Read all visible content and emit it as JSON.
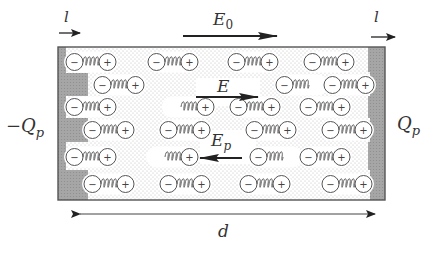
{
  "diagram": {
    "title_labels": {
      "current_left": "l",
      "current_right": "l",
      "applied_field": "E",
      "applied_field_sub": "0",
      "net_field": "E",
      "polarization_field": "E",
      "polarization_field_sub": "p",
      "left_charge_prefix": "−Q",
      "left_charge_sub": "p",
      "right_charge": "Q",
      "right_charge_sub": "p",
      "separation": "d"
    },
    "dipole": {
      "negative_symbol": "−",
      "positive_symbol": "+"
    },
    "colors": {
      "plate": "#a8a8a8",
      "dielectric_stipple": "#c8c8c8",
      "outline": "#555555",
      "arrow": "#222222"
    },
    "rows": [
      {
        "y": 62,
        "dipoles": [
          {
            "x": 66
          },
          {
            "x": 148
          },
          {
            "x": 228
          },
          {
            "x": 304
          }
        ]
      },
      {
        "y": 85,
        "dipoles": [
          {
            "x": 94
          },
          {
            "x": 276,
            "partial": "right"
          },
          {
            "x": 324
          }
        ]
      },
      {
        "y": 107,
        "dipoles": [
          {
            "x": 66
          },
          {
            "x": 164,
            "partial": "left"
          },
          {
            "x": 230
          },
          {
            "x": 300
          }
        ]
      },
      {
        "y": 130,
        "dipoles": [
          {
            "x": 84
          },
          {
            "x": 160
          },
          {
            "x": 246
          },
          {
            "x": 322
          }
        ]
      },
      {
        "y": 157,
        "dipoles": [
          {
            "x": 66
          },
          {
            "x": 148,
            "partial": "left"
          },
          {
            "x": 250,
            "partial": "right"
          },
          {
            "x": 300
          }
        ]
      },
      {
        "y": 184,
        "dipoles": [
          {
            "x": 84
          },
          {
            "x": 160
          },
          {
            "x": 240
          },
          {
            "x": 322
          }
        ]
      }
    ]
  }
}
